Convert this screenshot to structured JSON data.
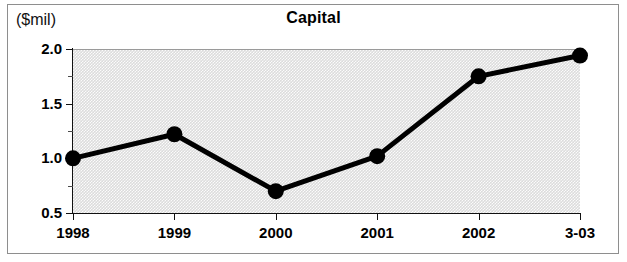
{
  "chart_data": {
    "type": "line",
    "title": "Capital",
    "units_label": "($mil)",
    "xlabel": "",
    "ylabel": "",
    "categories": [
      "1998",
      "1999",
      "2000",
      "2001",
      "2002",
      "3-03"
    ],
    "values": [
      1.0,
      1.22,
      0.7,
      1.02,
      1.75,
      1.94
    ],
    "series": [
      {
        "name": "Capital",
        "values": [
          1.0,
          1.22,
          0.7,
          1.02,
          1.75,
          1.94
        ]
      }
    ],
    "ylim": [
      0.5,
      2.0
    ],
    "y_ticks_major": [
      "0.5",
      "1.0",
      "1.5",
      "2.0"
    ],
    "y_tick_values": [
      0.5,
      1.0,
      1.5,
      2.0
    ],
    "y_ticks_minor": [
      0.75,
      1.25,
      1.75
    ],
    "grid": false,
    "legend": "none",
    "marker": "filled-circle",
    "colors": {
      "line": "#000000",
      "marker": "#000000",
      "plot_background": "#dcdcdc",
      "frame": "#8e8e8e",
      "text": "#000000"
    }
  }
}
